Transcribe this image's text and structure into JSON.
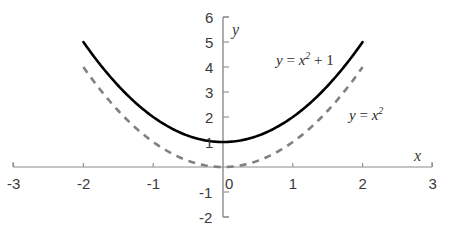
{
  "chart_data": {
    "type": "line",
    "title": "",
    "subtitle": "",
    "xlabel": "x",
    "ylabel": "y",
    "xlim": [
      -3,
      3
    ],
    "ylim": [
      -2,
      6
    ],
    "grid": false,
    "legend_position": "inline-annotations",
    "x_ticks": [
      "-3",
      "-2",
      "-1",
      "0",
      "1",
      "2",
      "3"
    ],
    "x_tick_values": [
      -3,
      -2,
      -1,
      0,
      1,
      2,
      3
    ],
    "y_ticks": [
      "6",
      "5",
      "4",
      "3",
      "2",
      "1",
      "-1",
      "-2"
    ],
    "y_tick_values": [
      6,
      5,
      4,
      3,
      2,
      1,
      -1,
      -2
    ],
    "series": [
      {
        "name": "y = x² + 1",
        "expression": "y = x^2 + 1",
        "style": "solid",
        "color": "#000000",
        "domain": [
          -2,
          2
        ],
        "x": [
          -2,
          -1.75,
          -1.5,
          -1.25,
          -1,
          -0.75,
          -0.5,
          -0.25,
          0,
          0.25,
          0.5,
          0.75,
          1,
          1.25,
          1.5,
          1.75,
          2
        ],
        "values": [
          5,
          4.0625,
          3.25,
          2.5625,
          2,
          1.5625,
          1.25,
          1.0625,
          1,
          1.0625,
          1.25,
          1.5625,
          2,
          2.5625,
          3.25,
          4.0625,
          5
        ],
        "vertex": [
          0,
          1
        ]
      },
      {
        "name": "y = x²",
        "expression": "y = x^2",
        "style": "dashed",
        "color": "#808080",
        "domain": [
          -2,
          2
        ],
        "x": [
          -2,
          -1.75,
          -1.5,
          -1.25,
          -1,
          -0.75,
          -0.5,
          -0.25,
          0,
          0.25,
          0.5,
          0.75,
          1,
          1.25,
          1.5,
          1.75,
          2
        ],
        "values": [
          4,
          3.0625,
          2.25,
          1.5625,
          1,
          0.5625,
          0.25,
          0.0625,
          0,
          0.0625,
          0.25,
          0.5625,
          1,
          1.5625,
          2.25,
          3.0625,
          4
        ],
        "vertex": [
          0,
          0
        ]
      }
    ],
    "annotations": [
      {
        "id": "label-shifted",
        "text": "y = x² + 1",
        "lead": "y = x",
        "exponent": "2",
        "trail": " + 1",
        "at": [
          0.78,
          3.9
        ]
      },
      {
        "id": "label-base",
        "text": "y = x²",
        "lead": "y = x",
        "exponent": "2",
        "trail": "",
        "at": [
          1.82,
          1.74
        ]
      }
    ]
  },
  "axes": {
    "x_axis_name": "x",
    "y_axis_name": "y"
  },
  "ticks": {
    "x": [
      {
        "label": "-3",
        "value": -3
      },
      {
        "label": "-2",
        "value": -2
      },
      {
        "label": "-1",
        "value": -1
      },
      {
        "label": "0",
        "value": 0
      },
      {
        "label": "1",
        "value": 1
      },
      {
        "label": "2",
        "value": 2
      },
      {
        "label": "3",
        "value": 3
      }
    ],
    "y": [
      {
        "label": "6",
        "value": 6
      },
      {
        "label": "5",
        "value": 5
      },
      {
        "label": "4",
        "value": 4
      },
      {
        "label": "3",
        "value": 3
      },
      {
        "label": "2",
        "value": 2
      },
      {
        "label": "1",
        "value": 1
      },
      {
        "label": "-1",
        "value": -1
      },
      {
        "label": "-2",
        "value": -2
      }
    ]
  },
  "colors": {
    "background": "#ffffff",
    "axis": "#808080",
    "solid_curve": "#000000",
    "dashed_curve": "#808080",
    "text": "#3a3a3a"
  }
}
